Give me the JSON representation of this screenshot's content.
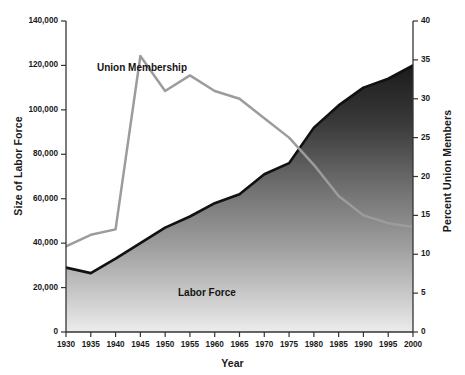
{
  "chart_data": {
    "type": "area",
    "title": "",
    "xlabel": "Year",
    "x": [
      1930,
      1935,
      1940,
      1945,
      1950,
      1955,
      1960,
      1965,
      1970,
      1975,
      1980,
      1985,
      1990,
      1995,
      2000
    ],
    "xtick_labels": [
      "1930",
      "1935",
      "1940",
      "1945",
      "1950",
      "1955",
      "1960",
      "1965",
      "1970",
      "1975",
      "1980",
      "1985",
      "1990",
      "1995",
      "2000"
    ],
    "xlim": [
      1930,
      2000
    ],
    "grid": false,
    "legend_position": "inline-annotations",
    "axes": [
      {
        "id": "left",
        "label": "Size of Labor Force",
        "ylim": [
          0,
          140000
        ],
        "ticks": [
          0,
          20000,
          40000,
          60000,
          80000,
          100000,
          120000,
          140000
        ],
        "tick_labels": [
          "0",
          "20,000",
          "40,000",
          "60,000",
          "80,000",
          "100,000",
          "120,000",
          "140,000"
        ]
      },
      {
        "id": "right",
        "label": "Percent Union Members",
        "ylim": [
          0,
          40
        ],
        "ticks": [
          0,
          5,
          10,
          15,
          20,
          25,
          30,
          35,
          40
        ],
        "tick_labels": [
          "0",
          "5",
          "10",
          "15",
          "20",
          "25",
          "30",
          "35",
          "40"
        ]
      }
    ],
    "series": [
      {
        "name": "Labor Force",
        "axis": "left",
        "type": "area",
        "unit": "thousands of workers",
        "color": "#111111",
        "fill": "gradient-gray",
        "values": [
          29000,
          26500,
          33000,
          40000,
          47000,
          52000,
          58000,
          62000,
          71000,
          76000,
          92000,
          102000,
          110000,
          114000,
          120000
        ]
      },
      {
        "name": "Union Membership",
        "axis": "right",
        "type": "line",
        "unit": "percent of labor force",
        "color": "#9c9c9c",
        "values": [
          11.0,
          12.5,
          13.2,
          35.5,
          31.0,
          33.0,
          31.0,
          30.0,
          27.5,
          25.0,
          21.5,
          17.5,
          15.0,
          14.0,
          13.5
        ]
      }
    ],
    "annotations": [
      {
        "text": "Union Membership",
        "series": "Union Membership"
      },
      {
        "text": "Labor Force",
        "series": "Labor Force"
      }
    ]
  }
}
